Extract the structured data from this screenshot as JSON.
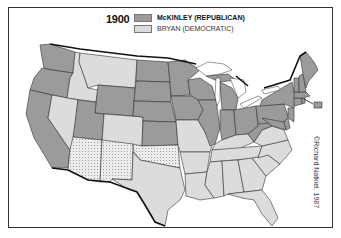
{
  "map": {
    "year": "1900",
    "legend": [
      {
        "label": "McKINLEY (REPUBLICAN)",
        "color": "#9b9b9b"
      },
      {
        "label": "BRYAN (DEMOCRATIC)",
        "color": "#dcdcdc"
      }
    ],
    "territory_pattern": "dotted",
    "credit": "©Richard Natkiel, 1987",
    "republican_states": [
      "WA",
      "OR",
      "CA",
      "WY",
      "ND",
      "SD",
      "NE",
      "KS",
      "UT",
      "MN",
      "IA",
      "WI",
      "MI",
      "IL",
      "IN",
      "OH",
      "WV",
      "PA",
      "NY",
      "VT",
      "NH",
      "ME",
      "MA",
      "RI",
      "CT",
      "NJ",
      "DE",
      "MD"
    ],
    "democratic_states": [
      "MT",
      "ID",
      "NV",
      "CO",
      "TX",
      "MO",
      "AR",
      "LA",
      "MS",
      "AL",
      "TN",
      "KY",
      "GA",
      "FL",
      "SC",
      "NC",
      "VA"
    ],
    "territories": [
      "AZ",
      "NM",
      "OK"
    ]
  }
}
